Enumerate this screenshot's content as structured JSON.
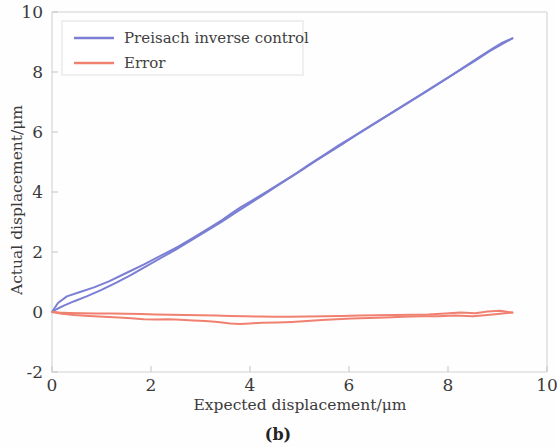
{
  "figure": {
    "caption": "(b)",
    "background_color": "#fffefe"
  },
  "chart_data": {
    "type": "line",
    "title": "",
    "xlabel": "Expected displacement/μm",
    "ylabel": "Actual displacement/μm",
    "xlim": [
      0,
      10
    ],
    "ylim": [
      -2,
      10
    ],
    "xticks": [
      0,
      2,
      4,
      6,
      8,
      10
    ],
    "xtick_labels": [
      "0",
      "2",
      "4",
      "6",
      "8",
      "10"
    ],
    "yticks": [
      -2,
      0,
      2,
      4,
      6,
      8,
      10
    ],
    "ytick_labels": [
      "-2",
      "0",
      "2",
      "4",
      "6",
      "8",
      "10"
    ],
    "grid": false,
    "legend_position": "top-left",
    "series": [
      {
        "name": "Preisach inverse control",
        "color": "#7b7fd4",
        "linewidth": 2.0,
        "branches": [
          {
            "label": "ascending",
            "x": [
              0.0,
              0.12,
              0.3,
              0.55,
              0.85,
              1.15,
              1.5,
              1.85,
              2.2,
              2.55,
              2.9,
              3.2,
              3.45,
              3.62,
              3.8,
              4.05,
              4.35,
              4.7,
              5.05,
              5.35,
              5.6,
              5.85,
              6.15,
              6.5,
              6.85,
              7.2,
              7.55,
              7.9,
              8.25,
              8.6,
              8.9,
              9.1,
              9.3
            ],
            "y": [
              0.0,
              0.3,
              0.52,
              0.66,
              0.82,
              1.02,
              1.3,
              1.58,
              1.88,
              2.18,
              2.52,
              2.82,
              3.08,
              3.28,
              3.48,
              3.72,
              4.02,
              4.38,
              4.74,
              5.06,
              5.32,
              5.58,
              5.9,
              6.26,
              6.62,
              6.98,
              7.34,
              7.7,
              8.08,
              8.46,
              8.78,
              8.98,
              9.12
            ]
          },
          {
            "label": "descending",
            "x": [
              9.3,
              9.1,
              8.85,
              8.55,
              8.2,
              7.85,
              7.5,
              7.15,
              6.8,
              6.45,
              6.1,
              5.8,
              5.5,
              5.2,
              4.9,
              4.6,
              4.3,
              4.0,
              3.7,
              3.4,
              3.1,
              2.8,
              2.5,
              2.2,
              1.9,
              1.6,
              1.3,
              1.0,
              0.7,
              0.45,
              0.25,
              0.1,
              0.0
            ],
            "y": [
              9.12,
              8.94,
              8.7,
              8.38,
              8.02,
              7.66,
              7.3,
              6.94,
              6.58,
              6.22,
              5.86,
              5.56,
              5.24,
              4.92,
              4.58,
              4.26,
              3.94,
              3.62,
              3.3,
              2.98,
              2.68,
              2.38,
              2.08,
              1.8,
              1.52,
              1.24,
              0.98,
              0.74,
              0.52,
              0.36,
              0.22,
              0.1,
              0.0
            ]
          }
        ]
      },
      {
        "name": "Error",
        "color": "#f08070",
        "linewidth": 2.0,
        "branches": [
          {
            "label": "ascending",
            "x": [
              0.0,
              0.2,
              0.45,
              0.75,
              1.05,
              1.35,
              1.6,
              1.85,
              2.1,
              2.35,
              2.6,
              2.85,
              3.1,
              3.35,
              3.6,
              3.8,
              4.0,
              4.25,
              4.55,
              4.85,
              5.15,
              5.45,
              5.75,
              6.05,
              6.4,
              6.75,
              7.1,
              7.45,
              7.8,
              8.15,
              8.5,
              8.8,
              9.05,
              9.3
            ],
            "y": [
              0.0,
              -0.06,
              -0.1,
              -0.13,
              -0.16,
              -0.18,
              -0.21,
              -0.24,
              -0.25,
              -0.24,
              -0.26,
              -0.28,
              -0.3,
              -0.33,
              -0.38,
              -0.4,
              -0.38,
              -0.36,
              -0.35,
              -0.33,
              -0.3,
              -0.27,
              -0.24,
              -0.22,
              -0.2,
              -0.18,
              -0.16,
              -0.14,
              -0.14,
              -0.12,
              -0.14,
              -0.1,
              -0.06,
              -0.02
            ]
          },
          {
            "label": "descending",
            "x": [
              9.3,
              9.05,
              8.8,
              8.55,
              8.25,
              7.95,
              7.6,
              7.25,
              6.9,
              6.55,
              6.2,
              5.85,
              5.5,
              5.15,
              4.8,
              4.5,
              4.2,
              3.9,
              3.6,
              3.3,
              3.0,
              2.7,
              2.4,
              2.1,
              1.8,
              1.5,
              1.2,
              0.9,
              0.6,
              0.35,
              0.15,
              0.0
            ],
            "y": [
              -0.02,
              0.04,
              0.02,
              -0.04,
              -0.02,
              -0.05,
              -0.08,
              -0.09,
              -0.1,
              -0.11,
              -0.12,
              -0.13,
              -0.14,
              -0.15,
              -0.16,
              -0.16,
              -0.15,
              -0.14,
              -0.13,
              -0.12,
              -0.11,
              -0.1,
              -0.09,
              -0.08,
              -0.07,
              -0.06,
              -0.05,
              -0.05,
              -0.04,
              -0.03,
              -0.02,
              0.0
            ]
          }
        ]
      }
    ]
  }
}
